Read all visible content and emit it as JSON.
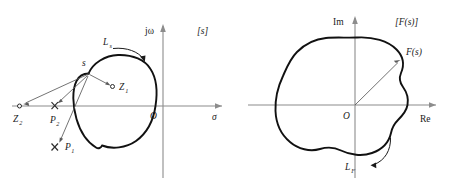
{
  "figure": {
    "background_color": "#ffffff",
    "contour_color": "#111111",
    "axis_color": "#8c8c8c",
    "vector_color": "#5a5a5a"
  },
  "left_panel": {
    "plane_label": "[s]",
    "axis_vertical_label": "jω",
    "axis_horizontal_label": "σ",
    "origin_label": "O",
    "contour_label_base": "L",
    "contour_label_sub": "s",
    "point_s_label": "s",
    "markers": [
      {
        "name": "zero-1",
        "glyph": "o",
        "label_base": "Z",
        "label_sub": "1"
      },
      {
        "name": "zero-2",
        "glyph": "o",
        "label_base": "Z",
        "label_sub": "2"
      },
      {
        "name": "pole-1",
        "glyph": "x",
        "label_base": "P",
        "label_sub": "1"
      },
      {
        "name": "pole-2",
        "glyph": "x",
        "label_base": "P",
        "label_sub": "2"
      }
    ]
  },
  "right_panel": {
    "plane_label": "[F(s)]",
    "axis_vertical_label": "Im",
    "axis_horizontal_label": "Re",
    "origin_label": "O",
    "vector_label": "F(s)",
    "contour_label_base": "L",
    "contour_label_sub": "F"
  }
}
